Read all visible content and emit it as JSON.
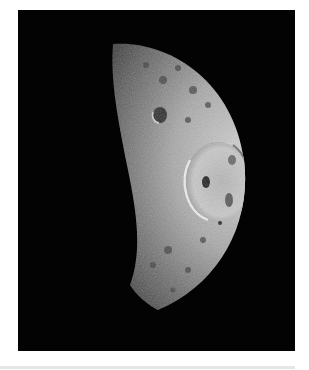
{
  "image": {
    "subject": "crescent moon with large crater",
    "alt": "Crescent-lit cratered moon with a large impact crater on the right side against black space",
    "colors": {
      "background": "#030303",
      "surface_light": "#cfcfcf",
      "surface_mid": "#7a7a7a",
      "surface_dark": "#2a2a2a",
      "page": "#ffffff",
      "rule": "#e6e6e6"
    }
  }
}
